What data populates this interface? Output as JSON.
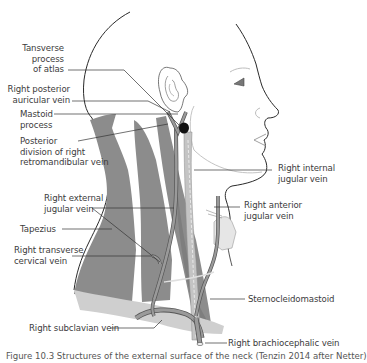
{
  "figure": {
    "type": "anatomical-diagram",
    "colors": {
      "muscle": "#8c8c8c",
      "muscle_light": "#c9c9c9",
      "vein_fill": "#9a9a9a",
      "outline": "#2a2a2a",
      "leader": "#333333",
      "label_text": "#3c3c3c",
      "face_light": "#bdbdbd"
    },
    "labels_left": [
      {
        "id": "transverse-process-atlas",
        "text_lines": [
          "Tansverse",
          "process",
          "of atlas"
        ]
      },
      {
        "id": "right-posterior-auricular-vein",
        "text_lines": [
          "Right posterior",
          "auricular vein"
        ]
      },
      {
        "id": "mastoid-process",
        "text_lines": [
          "Mastoid",
          "process"
        ]
      },
      {
        "id": "posterior-division-retromandibular",
        "text_lines": [
          "Posterior",
          "division of right",
          "retromandibular vein"
        ]
      },
      {
        "id": "right-external-jugular-vein",
        "text_lines": [
          "Right external",
          "jugular vein"
        ]
      },
      {
        "id": "trapezius",
        "text_lines": [
          "Tapezius"
        ]
      },
      {
        "id": "right-transverse-cervical-vein",
        "text_lines": [
          "Right transverse",
          "cervical vein"
        ]
      },
      {
        "id": "right-subclavian-vein",
        "text_lines": [
          "Right subclavian vein"
        ]
      }
    ],
    "labels_right": [
      {
        "id": "right-internal-jugular-vein",
        "text_lines": [
          "Right internal",
          "jugular vein"
        ]
      },
      {
        "id": "right-anterior-jugular-vein",
        "text_lines": [
          "Right anterior",
          "jugular vein"
        ]
      },
      {
        "id": "sternocleidomastoid",
        "text_lines": [
          "Sternocleidomastoid"
        ]
      },
      {
        "id": "right-brachiocephalic-vein",
        "text_lines": [
          "Right brachiocephalic vein"
        ]
      }
    ],
    "caption": "Figure 10.3  Structures of the external surface of the neck (Tenzin 2014 after Netter)"
  }
}
